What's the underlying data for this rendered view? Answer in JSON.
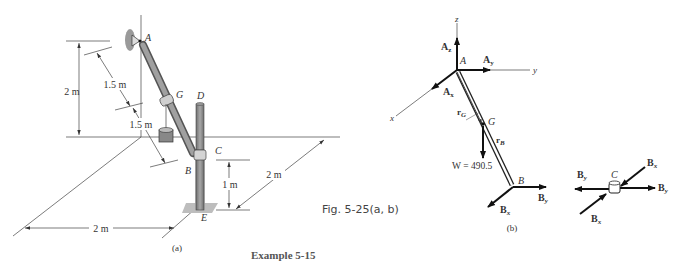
{
  "figure": {
    "caption": "Fig. 5-25(a, b)",
    "example_title": "Example 5-15",
    "part_a_label": "(a)",
    "part_b_label": "(b)"
  },
  "diagram_a": {
    "points": {
      "A": "A",
      "B": "B",
      "C": "C",
      "D": "D",
      "E": "E",
      "G": "G"
    },
    "dimensions": {
      "height_A": "2 m",
      "AG": "1.5 m",
      "GB": "1.5 m",
      "height_C": "1 m",
      "depth_y": "2 m",
      "width_x": "2 m"
    }
  },
  "diagram_b": {
    "axes": {
      "x": "x",
      "y": "y",
      "z": "z"
    },
    "points": {
      "A": "A",
      "G": "G",
      "B": "B"
    },
    "forces": {
      "Az": "A",
      "Az_sub": "z",
      "Ay": "A",
      "Ay_sub": "y",
      "Ax": "A",
      "Ax_sub": "x",
      "By": "B",
      "By_sub": "y",
      "Bx": "B",
      "Bx_sub": "x",
      "weight": "W = 490.5"
    },
    "vectors": {
      "rG": "r",
      "rG_sub": "G",
      "rB": "r",
      "rB_sub": "B"
    }
  },
  "diagram_c": {
    "point": "C",
    "forces": {
      "By_left": "B",
      "By_left_sub": "y",
      "By_right": "B",
      "By_right_sub": "y",
      "Bx_top": "B",
      "Bx_top_sub": "x",
      "Bx_bottom": "B",
      "Bx_bottom_sub": "x"
    }
  }
}
